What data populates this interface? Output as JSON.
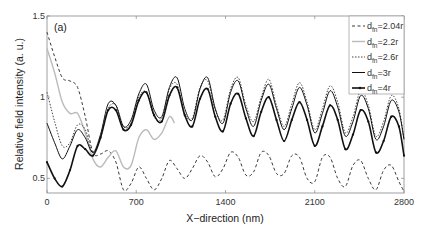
{
  "chart_data": {
    "type": "line",
    "panel_label": "(a)",
    "title": "",
    "xlabel": "X−direction (nm)",
    "ylabel": "Relative field intensity (a. u.)",
    "xlim": [
      0,
      2800
    ],
    "ylim": [
      0.41,
      1.5
    ],
    "xticks": [
      0,
      700,
      1400,
      2100,
      2800
    ],
    "yticks": [
      0.5,
      1,
      1.5
    ],
    "xtick_labels": [
      "0",
      "700",
      "1400",
      "2100",
      "2800"
    ],
    "ytick_labels": [
      "0.5",
      "1",
      "1.5"
    ],
    "grid": false,
    "legend_position": "upper right",
    "series": [
      {
        "name": "d_fn=2.04r",
        "label_main": "d",
        "label_sub": "fn",
        "label_tail": "=2.04r",
        "style": "dashed",
        "color": "#222222",
        "x": [
          0,
          60,
          120,
          180,
          240,
          300,
          360,
          420,
          480,
          540,
          600,
          660,
          720,
          780,
          840,
          900,
          960,
          1020,
          1080,
          1140,
          1200,
          1260,
          1320,
          1380,
          1440,
          1500,
          1560,
          1620,
          1680,
          1740,
          1800,
          1860,
          1920,
          1980,
          2040,
          2100,
          2160,
          2220,
          2280,
          2340,
          2400,
          2460,
          2520,
          2580,
          2640,
          2700,
          2760,
          2800
        ],
        "y": [
          1.4,
          1.25,
          1.12,
          1.1,
          1.06,
          0.88,
          0.66,
          0.65,
          0.67,
          0.6,
          0.43,
          0.47,
          0.57,
          0.5,
          0.43,
          0.5,
          0.61,
          0.56,
          0.5,
          0.56,
          0.64,
          0.6,
          0.51,
          0.56,
          0.66,
          0.63,
          0.52,
          0.54,
          0.66,
          0.64,
          0.53,
          0.53,
          0.64,
          0.63,
          0.5,
          0.48,
          0.63,
          0.63,
          0.5,
          0.45,
          0.58,
          0.61,
          0.5,
          0.43,
          0.55,
          0.58,
          0.48,
          0.42
        ]
      },
      {
        "name": "d_fn=2.2r",
        "label_main": "d",
        "label_sub": "fn",
        "label_tail": "=2.2r",
        "style": "dotted-light",
        "color": "#bbbbbb",
        "x": [
          0,
          60,
          120,
          180,
          240,
          300,
          360,
          420,
          480,
          540,
          600,
          660,
          720,
          780,
          840,
          900,
          960,
          1000
        ],
        "y": [
          1.3,
          1.15,
          0.97,
          0.9,
          0.9,
          0.78,
          0.62,
          0.57,
          0.63,
          0.67,
          0.57,
          0.58,
          0.75,
          0.8,
          0.74,
          0.78,
          0.88,
          0.84
        ]
      },
      {
        "name": "d_fn=2.6r",
        "label_main": "d",
        "label_sub": "fn",
        "label_tail": "=2.6r",
        "style": "dash-dot",
        "color": "#333333",
        "x": [
          0,
          60,
          120,
          180,
          240,
          300,
          360,
          420,
          480,
          540,
          600,
          660,
          720,
          780,
          840,
          900,
          960,
          1020,
          1080,
          1140,
          1200,
          1260,
          1320,
          1380,
          1440,
          1500,
          1560,
          1620,
          1680,
          1740,
          1800,
          1860,
          1920,
          1980,
          2040,
          2100,
          2160,
          2220,
          2280,
          2340,
          2400,
          2460,
          2520,
          2580,
          2640,
          2700,
          2760,
          2800
        ],
        "y": [
          1.03,
          0.85,
          0.7,
          0.72,
          0.83,
          0.8,
          0.66,
          0.75,
          0.93,
          0.95,
          0.82,
          0.84,
          1.0,
          1.03,
          0.88,
          0.87,
          1.05,
          1.08,
          0.9,
          0.87,
          1.06,
          1.1,
          0.92,
          0.86,
          1.05,
          1.12,
          0.95,
          0.85,
          1.0,
          1.11,
          0.95,
          0.82,
          0.96,
          1.09,
          0.97,
          0.8,
          0.93,
          1.07,
          0.97,
          0.78,
          0.88,
          1.04,
          0.95,
          0.76,
          0.85,
          1.01,
          0.93,
          0.74
        ]
      },
      {
        "name": "d_fn=3r",
        "label_main": "d",
        "label_sub": "fn",
        "label_tail": "=3r",
        "style": "solid",
        "color": "#111111",
        "x": [
          0,
          60,
          120,
          180,
          240,
          300,
          360,
          420,
          480,
          540,
          600,
          660,
          720,
          780,
          840,
          900,
          960,
          1020,
          1080,
          1140,
          1200,
          1260,
          1320,
          1380,
          1440,
          1500,
          1560,
          1620,
          1680,
          1740,
          1800,
          1860,
          1920,
          1980,
          2040,
          2100,
          2160,
          2220,
          2280,
          2340,
          2400,
          2460,
          2520,
          2580,
          2640,
          2700,
          2760,
          2800
        ],
        "y": [
          0.84,
          0.72,
          0.62,
          0.7,
          0.8,
          0.75,
          0.66,
          0.77,
          0.96,
          0.95,
          0.82,
          0.86,
          1.02,
          1.08,
          0.92,
          0.88,
          1.06,
          1.12,
          0.93,
          0.86,
          1.05,
          1.12,
          0.93,
          0.84,
          1.03,
          1.1,
          0.93,
          0.82,
          0.98,
          1.08,
          0.93,
          0.8,
          0.93,
          1.06,
          0.95,
          0.78,
          0.9,
          1.04,
          0.94,
          0.76,
          0.85,
          1.01,
          0.93,
          0.74,
          0.82,
          0.98,
          0.91,
          0.74
        ]
      },
      {
        "name": "d_fn=4r",
        "label_main": "d",
        "label_sub": "fn",
        "label_tail": "=4r",
        "style": "solid-marker",
        "color": "#111111",
        "x": [
          0,
          60,
          120,
          180,
          240,
          300,
          360,
          420,
          480,
          540,
          600,
          660,
          720,
          780,
          840,
          900,
          960,
          1020,
          1080,
          1140,
          1200,
          1260,
          1320,
          1380,
          1440,
          1500,
          1560,
          1620,
          1680,
          1740,
          1800,
          1860,
          1920,
          1980,
          2040,
          2100,
          2160,
          2220,
          2280,
          2340,
          2400,
          2460,
          2520,
          2580,
          2640,
          2700,
          2760,
          2800
        ],
        "y": [
          0.6,
          0.5,
          0.45,
          0.55,
          0.7,
          0.68,
          0.64,
          0.75,
          0.92,
          0.92,
          0.8,
          0.83,
          0.98,
          1.03,
          0.89,
          0.85,
          1.01,
          1.06,
          0.89,
          0.82,
          0.99,
          1.05,
          0.88,
          0.79,
          0.96,
          1.02,
          0.87,
          0.76,
          0.91,
          1.0,
          0.86,
          0.73,
          0.86,
          0.97,
          0.86,
          0.7,
          0.82,
          0.95,
          0.86,
          0.68,
          0.77,
          0.92,
          0.85,
          0.66,
          0.73,
          0.88,
          0.82,
          0.64
        ]
      }
    ]
  }
}
